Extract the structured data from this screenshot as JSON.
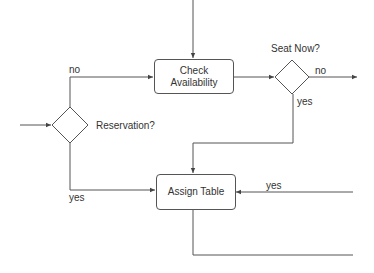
{
  "diagram": {
    "type": "flowchart",
    "nodes": {
      "check_availability": {
        "label_line1": "Check",
        "label_line2": "Availability"
      },
      "assign_table": {
        "label": "Assign Table"
      },
      "seat_now": {
        "label": "Seat Now?"
      },
      "reservation": {
        "label": "Reservation?"
      }
    },
    "edge_labels": {
      "reservation_no": "no",
      "reservation_yes": "yes",
      "seat_now_no": "no",
      "seat_now_yes": "yes",
      "external_yes": "yes"
    },
    "colors": {
      "stroke": "#555555",
      "text": "#333333",
      "background": "#ffffff"
    }
  }
}
